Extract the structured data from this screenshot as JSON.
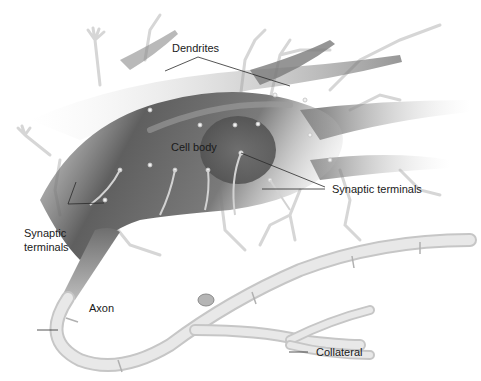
{
  "figure": {
    "labels": {
      "dendrites": "Dendrites",
      "cell_body": "Cell body",
      "synaptic_terminals_right": "Synaptic terminals",
      "synaptic_terminals_left_line1": "Synaptic",
      "synaptic_terminals_left_line2": "terminals",
      "axon": "Axon",
      "collateral": "Collateral"
    },
    "colors": {
      "background": "#ffffff",
      "cell_dark": "#5e5e5e",
      "cell_mid": "#8c8c8c",
      "dendrite_light": "#c8c8c8",
      "myelin": "#e4e4e4",
      "myelin_edge": "#c4c4c4",
      "leader_line": "#2a2a2a"
    }
  }
}
